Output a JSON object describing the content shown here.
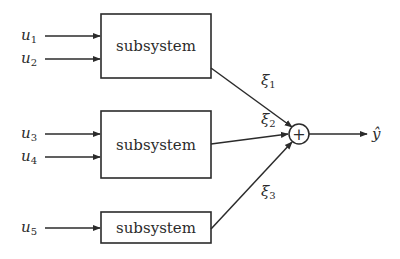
{
  "diagram": {
    "type": "block-diagram",
    "subsystems": [
      {
        "id": "subsystem-1",
        "label": "subsystem",
        "inputs": [
          "u1",
          "u2"
        ],
        "output": "ξ1"
      },
      {
        "id": "subsystem-2",
        "label": "subsystem",
        "inputs": [
          "u3",
          "u4"
        ],
        "output": "ξ2"
      },
      {
        "id": "subsystem-3",
        "label": "subsystem",
        "inputs": [
          "u5"
        ],
        "output": "ξ3"
      }
    ],
    "inputs": [
      {
        "base": "u",
        "sub": "1"
      },
      {
        "base": "u",
        "sub": "2"
      },
      {
        "base": "u",
        "sub": "3"
      },
      {
        "base": "u",
        "sub": "4"
      },
      {
        "base": "u",
        "sub": "5"
      }
    ],
    "intermediates": [
      {
        "base": "ξ",
        "sub": "1"
      },
      {
        "base": "ξ",
        "sub": "2"
      },
      {
        "base": "ξ",
        "sub": "3"
      }
    ],
    "summing_junction": {
      "symbol": "+"
    },
    "output": {
      "label": "ŷ"
    }
  }
}
